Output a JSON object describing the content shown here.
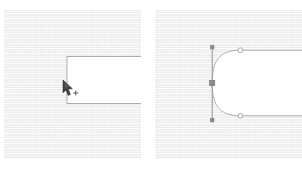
{
  "figure": {
    "background_color": "#ffffff",
    "canvas_texture_color": "#f2f2f2",
    "stroke_color": "#a9a9a9",
    "shape_fill_color": "#ffffff",
    "handle_color": "#9a9a9a",
    "anchor_fill_color": "#8c8c8c",
    "control_point_fill_color": "#fefefe",
    "cursor_color": "#3a3a3a"
  },
  "panels": [
    {
      "id": "panel-left",
      "name": "before-panel",
      "label": "",
      "x": 4,
      "y": 10,
      "width": 137,
      "height": 149,
      "shape": {
        "name": "open-rectangle-corner",
        "type": "path",
        "left_edge_x": 67,
        "top_edge_y": 56,
        "bottom_edge_y": 103,
        "right_extent_x": 141
      },
      "cursor": {
        "name": "pen-tool-cursor",
        "type": "pen",
        "x": 64,
        "y": 83,
        "crosshair_x": 76,
        "crosshair_y": 92
      }
    },
    {
      "id": "panel-right",
      "name": "after-panel",
      "label": "",
      "x": 155,
      "y": 10,
      "width": 147,
      "height": 149,
      "shape": {
        "name": "rounded-corner-bezier-path",
        "type": "path",
        "handle_line_x": 212,
        "handle_line_top_y": 46,
        "handle_line_bottom_y": 120,
        "top_tangent_y": 50,
        "bottom_tangent_y": 116,
        "curve_leftmost_x": 212,
        "curve_rightmost_x": 240,
        "right_extent_x": 302
      },
      "points": [
        {
          "name": "anchor-point-selected",
          "type": "square",
          "x": 212,
          "y": 83,
          "filled": true
        },
        {
          "name": "control-point-top",
          "type": "circle",
          "x": 240,
          "y": 50,
          "filled": false
        },
        {
          "name": "control-point-bottom",
          "type": "circle",
          "x": 240,
          "y": 116,
          "filled": false
        },
        {
          "name": "handle-end-top",
          "type": "square",
          "x": 212,
          "y": 47,
          "filled": true
        },
        {
          "name": "handle-end-bottom",
          "type": "square",
          "x": 212,
          "y": 119,
          "filled": true
        }
      ]
    }
  ]
}
